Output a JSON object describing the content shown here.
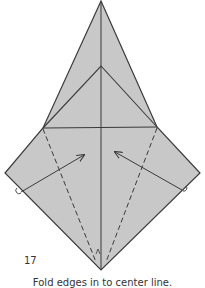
{
  "diagram": {
    "step_number": "17",
    "caption": "Fold edges in to center line.",
    "colors": {
      "paper": "#c8c8c8",
      "line": "#3a3a3a",
      "background": "#ffffff"
    },
    "symbols": [
      "valley-fold-dashed-line-left",
      "valley-fold-dashed-line-right",
      "fold-arrow-left",
      "fold-arrow-right",
      "pivot-mark-left",
      "pivot-mark-right"
    ]
  }
}
